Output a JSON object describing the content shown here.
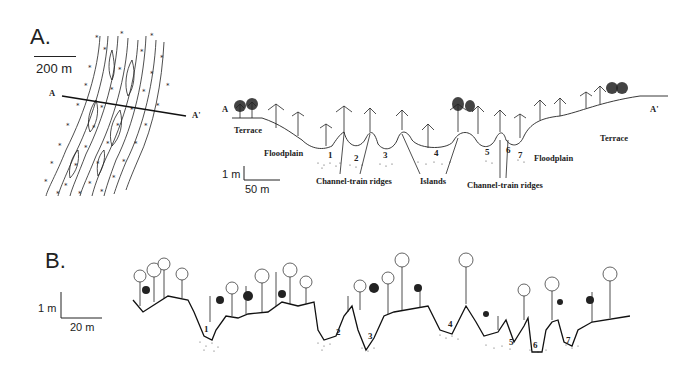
{
  "panel_a": {
    "label": "A.",
    "map": {
      "scale_label": "200 m",
      "section_start": "A",
      "section_end": "A'"
    },
    "profile": {
      "start_label": "A",
      "end_label": "A'",
      "scale_vertical": "1 m",
      "scale_horizontal": "50 m",
      "landforms": [
        "Terrace",
        "Floodplain",
        "Channel-train ridges",
        "Islands",
        "Channel-train ridges",
        "Floodplain",
        "Terrace"
      ],
      "labels": {
        "terrace_left": "Terrace",
        "floodplain_left": "Floodplain",
        "channel_ridges_left": "Channel-train ridges",
        "islands": "Islands",
        "channel_ridges_right": "Channel-train ridges",
        "floodplain_right": "Floodplain",
        "terrace_right": "Terrace"
      },
      "channels": [
        "1",
        "2",
        "3",
        "4",
        "5",
        "6",
        "7"
      ]
    }
  },
  "panel_b": {
    "label": "B.",
    "scale_vertical": "1 m",
    "scale_horizontal": "20 m",
    "channels": [
      "1",
      "2",
      "3",
      "4",
      "5",
      "6",
      "7"
    ]
  }
}
